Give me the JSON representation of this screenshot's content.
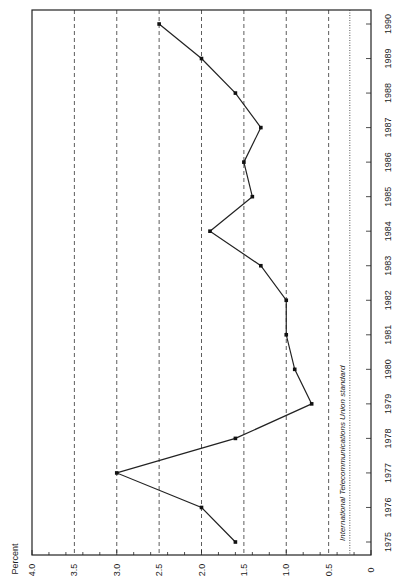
{
  "chart_data": {
    "type": "line",
    "title": "",
    "xlabel": "",
    "ylabel": "Percent",
    "orientation": "rotated-90-clockwise",
    "categories": [
      "1975",
      "1976",
      "1977",
      "1978",
      "1979",
      "1980",
      "1981",
      "1982",
      "1983",
      "1984",
      "1985",
      "1986",
      "1987",
      "1988",
      "1989",
      "1990"
    ],
    "series": [
      {
        "name": "Percent",
        "values": [
          1.6,
          2.0,
          3.0,
          1.6,
          0.7,
          0.9,
          1.0,
          1.0,
          1.3,
          1.9,
          1.4,
          1.5,
          1.3,
          1.6,
          2.0,
          2.5
        ]
      }
    ],
    "ylim": [
      0,
      4.0
    ],
    "yticks": [
      "0",
      "0.5",
      "1.0",
      "1.5",
      "2.0",
      "2.5",
      "3.0",
      "3.5",
      "4.0"
    ],
    "grid": true,
    "reference_line": {
      "value": 0.25,
      "label": "International Telecommunications Union standard"
    },
    "legend": null
  },
  "labels": {
    "ylabel": "Percent",
    "reference": "International Telecommunications Union standard"
  }
}
